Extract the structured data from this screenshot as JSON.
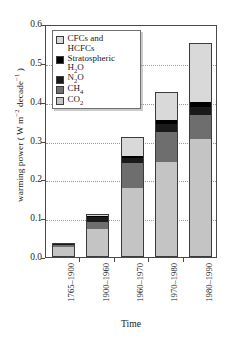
{
  "chart_data": {
    "type": "bar",
    "subtype": "stacked",
    "title": "",
    "xlabel": "Time",
    "ylabel": "warming power ( W m⁻² decade⁻¹ )",
    "ylabel_parts": {
      "prefix": "warming power ( W m",
      "sup1": "−2",
      "mid": " decade",
      "sup2": "−1",
      "suffix": " )"
    },
    "categories": [
      "1765–1900",
      "1900–1960",
      "1960–1970",
      "1970–1980",
      "1980–1990"
    ],
    "ylim": [
      0.0,
      0.6
    ],
    "yticks": [
      "0.6",
      "0.5",
      "0.4",
      "0.3",
      "0.2",
      "0.1",
      "0.0"
    ],
    "ytick_values": [
      0.6,
      0.5,
      0.4,
      0.3,
      0.2,
      0.1,
      0.0
    ],
    "grid": "horizontal-dotted",
    "legend_position": "top-left-inside",
    "series": [
      {
        "name": "CO2",
        "label": "CO",
        "label_sub": "2",
        "color": "#c4c4c4",
        "values": [
          0.028,
          0.073,
          0.178,
          0.244,
          0.303
        ]
      },
      {
        "name": "CH4",
        "label": "CH",
        "label_sub": "4",
        "color": "#6e6e6e",
        "values": [
          0.004,
          0.018,
          0.064,
          0.078,
          0.063
        ]
      },
      {
        "name": "N2O",
        "label": "N",
        "label_sub": "2",
        "label_tail": "O",
        "color": "#1a1a1a",
        "values": [
          0.003,
          0.012,
          0.013,
          0.021,
          0.02
        ]
      },
      {
        "name": "Stratospheric H2O",
        "label": "Stratospheric\nH",
        "label_sub": "2",
        "label_tail": "O",
        "color": "#000000",
        "values": [
          0.001,
          0.003,
          0.005,
          0.01,
          0.012
        ]
      },
      {
        "name": "CFCs and HCFCs",
        "label": "CFCs and\nHCFCs",
        "color": "#d9d9d9",
        "values": [
          0.0,
          0.004,
          0.05,
          0.072,
          0.152
        ]
      }
    ],
    "totals": [
      0.036,
      0.11,
      0.31,
      0.425,
      0.55
    ]
  },
  "legend": {
    "items": [
      {
        "key": "cfcs",
        "color": "#d9d9d9",
        "line1": "CFCs and",
        "line2": "HCFCs"
      },
      {
        "key": "strat-h2o",
        "color": "#000000",
        "line1": "Stratospheric",
        "line2": "H",
        "sub": "2",
        "tail": "O"
      },
      {
        "key": "n2o",
        "color": "#1a1a1a",
        "line1": "N",
        "sub": "2",
        "tail": "O"
      },
      {
        "key": "ch4",
        "color": "#6e6e6e",
        "line1": "CH",
        "sub": "4"
      },
      {
        "key": "co2",
        "color": "#c4c4c4",
        "line1": "CO",
        "sub": "2"
      }
    ]
  },
  "colors": {
    "axis": "#4a4a4a",
    "grid": "#9a9a9a",
    "text": "#1a1a1a",
    "background": "#ffffff",
    "bar_edge": "#3c3c3c"
  }
}
